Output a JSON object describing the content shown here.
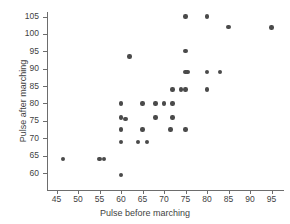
{
  "chart_data": {
    "type": "scatter",
    "title": "",
    "xlabel": "Pulse before marching",
    "ylabel": "Pulse after marching",
    "xlim": [
      43,
      97
    ],
    "ylim": [
      58,
      107
    ],
    "xticks": [
      45,
      50,
      55,
      60,
      65,
      70,
      75,
      80,
      85,
      90,
      95
    ],
    "yticks": [
      60,
      65,
      70,
      75,
      80,
      85,
      90,
      95,
      100,
      105
    ],
    "grid": false,
    "legend": null,
    "marker_color": "#4a4a4a",
    "axis_color": "#6d6d6d",
    "points": [
      {
        "x": 46.5,
        "y": 64
      },
      {
        "x": 55,
        "y": 64
      },
      {
        "x": 56,
        "y": 64
      },
      {
        "x": 60,
        "y": 59.5
      },
      {
        "x": 60,
        "y": 69
      },
      {
        "x": 60,
        "y": 72.5
      },
      {
        "x": 60,
        "y": 76
      },
      {
        "x": 60,
        "y": 80
      },
      {
        "x": 61,
        "y": 75.5
      },
      {
        "x": 62,
        "y": 93.5
      },
      {
        "x": 64,
        "y": 69
      },
      {
        "x": 65,
        "y": 72.5
      },
      {
        "x": 65,
        "y": 80
      },
      {
        "x": 66,
        "y": 69
      },
      {
        "x": 68,
        "y": 76
      },
      {
        "x": 68,
        "y": 80
      },
      {
        "x": 70,
        "y": 80
      },
      {
        "x": 71.5,
        "y": 72.5
      },
      {
        "x": 72,
        "y": 76
      },
      {
        "x": 72,
        "y": 80
      },
      {
        "x": 72,
        "y": 84
      },
      {
        "x": 74,
        "y": 84
      },
      {
        "x": 75,
        "y": 72.5
      },
      {
        "x": 75,
        "y": 84
      },
      {
        "x": 75,
        "y": 89
      },
      {
        "x": 75.5,
        "y": 89
      },
      {
        "x": 75,
        "y": 95
      },
      {
        "x": 75,
        "y": 105
      },
      {
        "x": 80,
        "y": 84
      },
      {
        "x": 80,
        "y": 89
      },
      {
        "x": 80,
        "y": 105
      },
      {
        "x": 83,
        "y": 89
      },
      {
        "x": 85,
        "y": 102
      },
      {
        "x": 95,
        "y": 101.8
      }
    ]
  }
}
